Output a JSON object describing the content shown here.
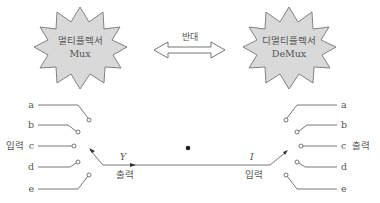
{
  "diagram": {
    "mux": {
      "title_ko": "멀티플렉서",
      "title_en": "Mux"
    },
    "demux": {
      "title_ko": "디멀티플렉서",
      "title_en": "DeMux"
    },
    "relation_label": "반대",
    "mux_side": {
      "inputs": [
        "a",
        "b",
        "c",
        "d",
        "e"
      ],
      "input_label": "입력",
      "output_symbol": "Y",
      "output_label": "출력"
    },
    "demux_side": {
      "outputs": [
        "a",
        "b",
        "c",
        "d",
        "e"
      ],
      "output_label": "출력",
      "input_symbol": "I",
      "input_label": "입력"
    }
  },
  "colors": {
    "star_fill": "#d9d9d9",
    "line": "#555555",
    "background": "#ffffff"
  }
}
